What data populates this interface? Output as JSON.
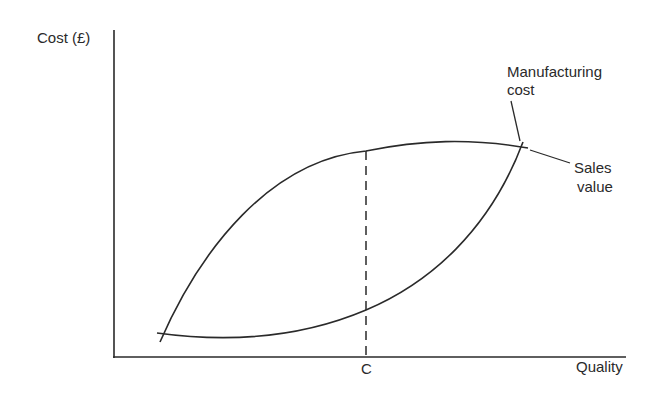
{
  "diagram": {
    "type": "line-curves",
    "y_axis_label": "Cost (£)",
    "x_axis_label": "Quality",
    "marker_label": "C",
    "curves": [
      {
        "name": "Manufacturing cost",
        "label_line1": "Manufacturing",
        "label_line2": "cost",
        "shape": "convex increasing (low at start, rising steeply to meet sales value)"
      },
      {
        "name": "Sales value",
        "label_line1": "Sales",
        "label_line2": "value",
        "shape": "concave increasing (rises steeply then flattens)"
      }
    ],
    "annotations": [
      {
        "type": "dashed-vertical",
        "at": "C",
        "meaning": "quality level of maximum gap between sales value and manufacturing cost"
      }
    ],
    "colors": {
      "line": "#2a2a2a",
      "background": "#ffffff"
    }
  }
}
